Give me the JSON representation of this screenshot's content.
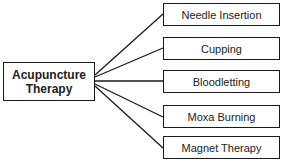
{
  "root": {
    "line1": "Acupuncture",
    "line2": "Therapy"
  },
  "children": [
    {
      "label": "Needle Insertion",
      "top": 3
    },
    {
      "label": "Cupping",
      "top": 37
    },
    {
      "label": "Bloodletting",
      "top": 70
    },
    {
      "label": "Moxa Burning",
      "top": 105
    },
    {
      "label": "Magnet Therapy",
      "top": 136
    }
  ]
}
